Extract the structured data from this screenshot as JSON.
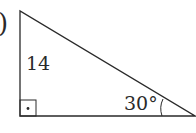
{
  "figure": {
    "label_fragment": ")",
    "side_label": "14",
    "angle_label": "30°",
    "right_angle_marker": "dot-in-square",
    "stroke_color": "#2a2a2a"
  }
}
